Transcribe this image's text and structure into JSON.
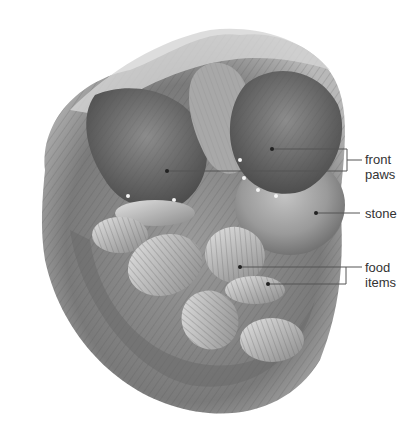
{
  "figure": {
    "style": "grayscale pencil illustration",
    "colors": {
      "background": "#ffffff",
      "fur_dark": "#5a5a5a",
      "fur_mid": "#8a8a8a",
      "fur_light": "#c8c8c8",
      "stone": "#9a9a9a",
      "shell_light": "#d8d8d8",
      "shell_dark": "#6e6e6e",
      "leader_line": "#555555",
      "label_text": "#333333"
    }
  },
  "labels": [
    {
      "id": "front-paws",
      "lines": [
        "front",
        "paws"
      ],
      "anchors": [
        [
          272,
          149
        ],
        [
          167,
          171
        ]
      ]
    },
    {
      "id": "stone",
      "lines": [
        "stone"
      ],
      "anchors": [
        [
          316,
          213
        ]
      ]
    },
    {
      "id": "food-items",
      "lines": [
        "food",
        "items"
      ],
      "anchors": [
        [
          240,
          267
        ],
        [
          268,
          284
        ]
      ]
    }
  ]
}
